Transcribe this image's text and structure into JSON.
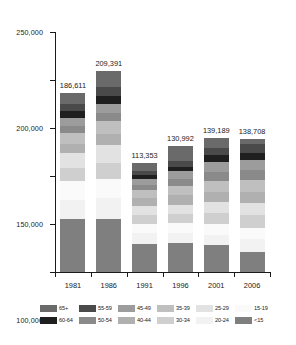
{
  "chart_data": {
    "type": "bar",
    "title": "",
    "subtitle": "",
    "xlabel": "",
    "ylabel": "",
    "stacked": true,
    "grid": false,
    "legend_position": "bottom",
    "ylim": [
      0,
      250000
    ],
    "yticks": [
      0,
      50000,
      100000,
      150000,
      200000,
      250000
    ],
    "ytick_labels": [
      "0",
      "50,000",
      "100,000",
      "150,000",
      "200,000",
      "250,000"
    ],
    "categories": [
      "1981",
      "1986",
      "1991",
      "1996",
      "2001",
      "2006"
    ],
    "totals": [
      186611,
      209391,
      113353,
      130992,
      139189,
      138708
    ],
    "total_labels": [
      "186,611",
      "209,391",
      "113,353",
      "130,992",
      "139,189",
      "138,708"
    ],
    "series": [
      {
        "name": "<15",
        "color": "#7f7f7f",
        "values": [
          55000,
          55500,
          32000,
          32500,
          28000,
          21000
        ]
      },
      {
        "name": "20-24",
        "color": "#f2f2f2",
        "values": [
          20500,
          22000,
          12500,
          11500,
          11000,
          13500
        ]
      },
      {
        "name": "15-19",
        "color": "#fafafa",
        "values": [
          19500,
          19000,
          10000,
          11000,
          11000,
          11500
        ]
      },
      {
        "name": "30-34",
        "color": "#cfcfcf",
        "values": [
          13000,
          17000,
          10000,
          10000,
          11500,
          13000
        ]
      },
      {
        "name": "25-29",
        "color": "#e2e2e2",
        "values": [
          16000,
          18500,
          10500,
          10500,
          11000,
          12500
        ]
      },
      {
        "name": "40-44",
        "color": "#b0b0b0",
        "values": [
          9500,
          11500,
          8500,
          10500,
          11000,
          11500
        ]
      },
      {
        "name": "35-39",
        "color": "#bfbfbf",
        "values": [
          11000,
          14000,
          9500,
          10500,
          11500,
          12500
        ]
      },
      {
        "name": "50-54",
        "color": "#8a8a8a",
        "values": [
          7500,
          8000,
          5500,
          7500,
          9500,
          10500
        ]
      },
      {
        "name": "45-49",
        "color": "#9c9c9c",
        "values": [
          8500,
          9500,
          6500,
          9000,
          10500,
          11000
        ]
      },
      {
        "name": "60-64",
        "color": "#1f1f1f",
        "values": [
          7500,
          8500,
          4500,
          5000,
          6500,
          7500
        ]
      },
      {
        "name": "55-59",
        "color": "#4a4a4a",
        "values": [
          7000,
          9000,
          5000,
          6000,
          7500,
          9000
        ]
      },
      {
        "name": "65+",
        "color": "#6a6a6a",
        "values": [
          11611,
          16891,
          8853,
          16992,
          10189,
          5208
        ]
      }
    ],
    "legend_order": [
      "65+",
      "55-59",
      "45-49",
      "35-39",
      "25-29",
      "15-19",
      "60-64",
      "50-54",
      "40-44",
      "30-34",
      "20-24",
      "<15"
    ],
    "legend_colors": {
      "65+": "#6a6a6a",
      "55-59": "#4a4a4a",
      "45-49": "#9c9c9c",
      "35-39": "#bfbfbf",
      "25-29": "#e2e2e2",
      "15-19": "#fafafa",
      "60-64": "#1f1f1f",
      "50-54": "#8a8a8a",
      "40-44": "#b0b0b0",
      "30-34": "#cfcfcf",
      "20-24": "#f2f2f2",
      "<15": "#7f7f7f"
    }
  }
}
